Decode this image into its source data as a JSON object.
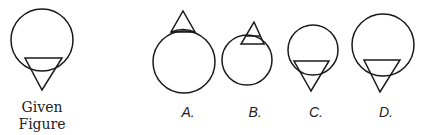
{
  "given": {
    "label_line1": "Given",
    "label_line2": "Figure",
    "circle": {
      "cx": 42,
      "cy": 40,
      "r": 31
    },
    "triangle": "25,58 62,58 42,90"
  },
  "options": [
    {
      "label": "A.",
      "circle": {
        "cx": 184,
        "cy": 62,
        "r": 31
      },
      "triangle": "171,32 195,32 183,11",
      "chord": ""
    },
    {
      "label": "B.",
      "circle": {
        "cx": 247,
        "cy": 60,
        "r": 25
      },
      "triangle": "241,44 264,44 254,22",
      "chord": ""
    },
    {
      "label": "C.",
      "circle": {
        "cx": 313,
        "cy": 50,
        "r": 25
      },
      "triangle": "294,61 329,61 311,91",
      "chord": ""
    },
    {
      "label": "D.",
      "circle": {
        "cx": 383,
        "cy": 45,
        "r": 31
      },
      "triangle": "364,60 400,60 380,92",
      "chord": ""
    }
  ],
  "colors": {
    "stroke": "#1a1a1a",
    "background": "#ffffff"
  }
}
